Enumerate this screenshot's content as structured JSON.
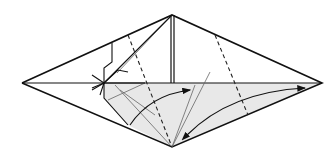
{
  "diagram": {
    "type": "origami-folding-step",
    "background": "#ffffff",
    "colors": {
      "outline": "#111111",
      "shade": "#e8e8e8",
      "thin_line": "#555555",
      "valley_fold": "#222222"
    },
    "points": {
      "left": [
        22,
        83
      ],
      "top": [
        172,
        15
      ],
      "right": [
        322,
        83
      ],
      "bottom": [
        172,
        147
      ]
    },
    "annotations": [
      {
        "kind": "valley-fold-line",
        "from": [
          128,
          35
        ],
        "to": [
          172,
          147
        ]
      },
      {
        "kind": "valley-fold-line",
        "from": [
          215,
          35
        ],
        "to": [
          248,
          115
        ]
      },
      {
        "kind": "fold-arrow",
        "from": [
          130,
          115
        ],
        "to": [
          190,
          90
        ]
      },
      {
        "kind": "fold-arrow-double",
        "from": [
          190,
          135
        ],
        "to": [
          305,
          88
        ]
      }
    ]
  }
}
